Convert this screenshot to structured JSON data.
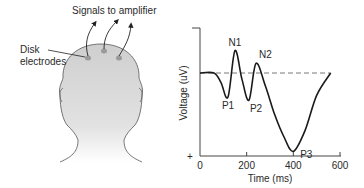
{
  "figure": {
    "left_panel": {
      "signals_label": "Signals to amplifier",
      "electrodes_label_line1": "Disk",
      "electrodes_label_line2": "electrodes",
      "electrode_count": 3
    },
    "right_panel": {
      "peak_labels": [
        "P1",
        "N1",
        "P2",
        "N2",
        "P3"
      ]
    }
  },
  "chart_data": {
    "type": "line",
    "title": "",
    "xlabel": "Time (ms)",
    "ylabel": "Voltage (uV)",
    "xlim": [
      0,
      600
    ],
    "x_ticks": [
      "0",
      "200",
      "400",
      "600"
    ],
    "y_axis_sign_bottom": "+",
    "y_axis_inverted": true,
    "baseline": "dashed",
    "grid": false,
    "series": [
      {
        "name": "Evoked potential",
        "x": [
          0,
          60,
          90,
          120,
          150,
          180,
          210,
          240,
          280,
          320,
          360,
          400,
          450,
          500,
          560
        ],
        "values": [
          0,
          0,
          0.3,
          0.75,
          -0.7,
          0.2,
          0.85,
          -0.3,
          0.4,
          1.3,
          2.0,
          2.45,
          1.8,
          0.7,
          0
        ]
      }
    ],
    "annotations": [
      {
        "text": "P1",
        "x": 120,
        "y": 0.75
      },
      {
        "text": "N1",
        "x": 150,
        "y": -0.7
      },
      {
        "text": "P2",
        "x": 240,
        "y": 0.85
      },
      {
        "text": "N2",
        "x": 280,
        "y": -0.3
      },
      {
        "text": "P3",
        "x": 400,
        "y": 2.45
      }
    ]
  }
}
